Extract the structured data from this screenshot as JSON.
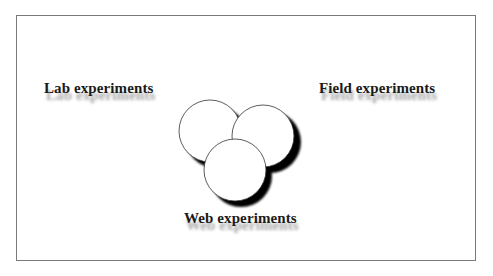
{
  "diagram": {
    "labels": {
      "lab": "Lab experiments",
      "field": "Field experiments",
      "web": "Web experiments"
    },
    "circles": [
      {
        "name": "lab",
        "cx": 210,
        "cy": 131,
        "r": 31
      },
      {
        "name": "field",
        "cx": 263,
        "cy": 136,
        "r": 31
      },
      {
        "name": "web",
        "cx": 235,
        "cy": 170,
        "r": 31
      }
    ],
    "colors": {
      "circle_fill": "#ffffff",
      "circle_stroke": "#333333",
      "shadow": "#000000",
      "frame_border": "#7a7a7a",
      "text": "#1a1a1a"
    }
  }
}
